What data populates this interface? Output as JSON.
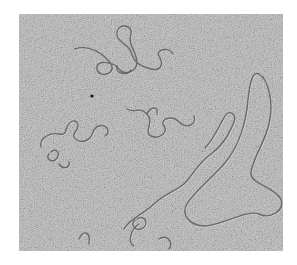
{
  "image": {
    "subject": "electron micrograph of DNA strands",
    "palette": {
      "background": "#ffffff",
      "field": "#b9b9b9",
      "strand": "#5a5a5a"
    }
  }
}
